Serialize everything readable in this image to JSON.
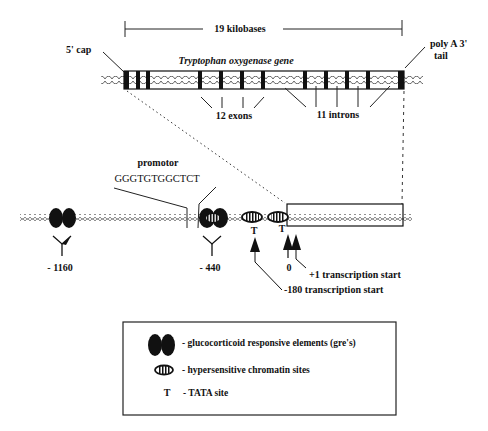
{
  "diagram": {
    "type": "gene-structure",
    "title": "Tryptophan oxygenase gene",
    "scale_bar": {
      "label": "19 kilobases"
    },
    "gene": {
      "five_prime_label": "5' cap",
      "three_prime_label_line1": "poly A 3'",
      "three_prime_label_line2": "tail",
      "exons_label": "12 exons",
      "introns_label": "11 introns",
      "exon_count": 12,
      "intron_count": 11
    },
    "promoter_region": {
      "promotor_label": "promotor",
      "promotor_sequence": "GGGTGTGGCTCT",
      "gre_positions": [
        {
          "label": "- 1160"
        },
        {
          "label": "- 440"
        }
      ],
      "tata_labels": [
        "T",
        "T"
      ],
      "transcription_starts": {
        "zero_label": "0",
        "plus_one_label": "+1 transcription start",
        "minus_180_label": "-180 transcription start"
      }
    },
    "legend": {
      "items": [
        {
          "symbol": "gre-pair",
          "text": "- glucocorticoid responsive elements (gre's)"
        },
        {
          "symbol": "hypersensitive-site",
          "text": "- hypersensitive chromatin sites"
        },
        {
          "symbol": "T",
          "text": "- TATA site"
        }
      ]
    }
  },
  "colors": {
    "ink": "#111111",
    "dna": "#555555",
    "background": "#ffffff"
  }
}
